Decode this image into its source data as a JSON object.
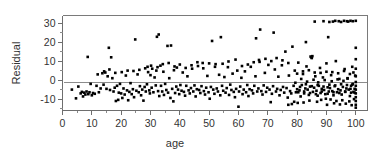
{
  "chart_data": {
    "type": "scatter",
    "title": "",
    "xlabel": "age",
    "ylabel": "Residual",
    "xlim": [
      0,
      104
    ],
    "ylim": [
      -16,
      34
    ],
    "xticks": [
      0,
      10,
      20,
      30,
      40,
      50,
      60,
      70,
      80,
      90,
      100
    ],
    "xticklabels": [
      "0",
      "10",
      "20",
      "30",
      "40",
      "50",
      "60",
      "70",
      "80",
      "90",
      "100"
    ],
    "yticks": [
      -10,
      0,
      10,
      20,
      30
    ],
    "yticklabels": [
      "-10",
      "0",
      "10",
      "20",
      "30"
    ],
    "grid": false,
    "legend": null,
    "minor_ticks": true,
    "marker": "square",
    "marker_color": "#000000",
    "marker_size": 2.6,
    "reference_line": {
      "type": "horizontal",
      "y": -1.0,
      "color": "#8c8c8c"
    },
    "frame": {
      "top": true,
      "right": true,
      "bottom": true,
      "left": true,
      "color": "#7a7a7a"
    },
    "points": [
      [
        3.2,
        -5.0
      ],
      [
        4.6,
        -9.6
      ],
      [
        5.4,
        -3.4
      ],
      [
        6.2,
        -7.0
      ],
      [
        6.6,
        -6.2
      ],
      [
        7.0,
        -8.6
      ],
      [
        7.4,
        -6.6
      ],
      [
        7.8,
        -7.6
      ],
      [
        8.2,
        -6.0
      ],
      [
        8.6,
        12.2
      ],
      [
        8.8,
        -7.4
      ],
      [
        9.2,
        -6.4
      ],
      [
        9.6,
        -2.0
      ],
      [
        10.0,
        -8.0
      ],
      [
        10.4,
        -6.8
      ],
      [
        11.0,
        -7.2
      ],
      [
        11.6,
        -3.0
      ],
      [
        12.4,
        -6.4
      ],
      [
        13.0,
        -4.4
      ],
      [
        13.6,
        3.6
      ],
      [
        14.0,
        -2.4
      ],
      [
        14.6,
        4.0
      ],
      [
        15.0,
        -4.6
      ],
      [
        15.4,
        2.0
      ],
      [
        15.8,
        17.0
      ],
      [
        16.2,
        -5.2
      ],
      [
        16.6,
        12.0
      ],
      [
        17.0,
        1.0
      ],
      [
        17.4,
        -6.0
      ],
      [
        17.8,
        -4.0
      ],
      [
        18.2,
        -11.0
      ],
      [
        18.6,
        -3.0
      ],
      [
        19.0,
        -10.4
      ],
      [
        19.2,
        -6.6
      ],
      [
        19.6,
        -2.0
      ],
      [
        20.0,
        -7.0
      ],
      [
        20.4,
        -9.4
      ],
      [
        20.8,
        -4.4
      ],
      [
        21.2,
        -7.6
      ],
      [
        21.6,
        2.4
      ],
      [
        22.0,
        -5.4
      ],
      [
        22.4,
        -10.6
      ],
      [
        22.8,
        -6.2
      ],
      [
        23.2,
        -1.6
      ],
      [
        23.6,
        -7.4
      ],
      [
        24.0,
        -4.8
      ],
      [
        24.4,
        -9.0
      ],
      [
        24.8,
        21.4
      ],
      [
        25.2,
        -5.6
      ],
      [
        25.6,
        3.0
      ],
      [
        26.0,
        -6.4
      ],
      [
        26.4,
        -3.2
      ],
      [
        26.8,
        -8.0
      ],
      [
        27.2,
        -5.0
      ],
      [
        27.6,
        -10.8
      ],
      [
        28.0,
        -3.6
      ],
      [
        28.4,
        -6.0
      ],
      [
        28.8,
        -2.2
      ],
      [
        29.0,
        7.0
      ],
      [
        29.2,
        4.2
      ],
      [
        29.6,
        -5.4
      ],
      [
        29.8,
        -7.0
      ],
      [
        30.0,
        2.6
      ],
      [
        30.4,
        -4.0
      ],
      [
        30.6,
        6.0
      ],
      [
        31.0,
        -6.4
      ],
      [
        31.4,
        1.4
      ],
      [
        31.8,
        -2.8
      ],
      [
        32.0,
        5.0
      ],
      [
        32.2,
        22.8
      ],
      [
        32.6,
        -5.8
      ],
      [
        32.8,
        24.0
      ],
      [
        33.0,
        -8.4
      ],
      [
        33.4,
        7.6
      ],
      [
        33.6,
        -3.0
      ],
      [
        34.0,
        -6.0
      ],
      [
        34.4,
        4.4
      ],
      [
        34.6,
        -7.8
      ],
      [
        35.0,
        -2.0
      ],
      [
        35.4,
        -5.2
      ],
      [
        35.8,
        18.0
      ],
      [
        36.0,
        -6.6
      ],
      [
        36.4,
        1.0
      ],
      [
        36.8,
        -9.4
      ],
      [
        37.0,
        18.2
      ],
      [
        37.4,
        -4.6
      ],
      [
        37.8,
        -11.2
      ],
      [
        38.0,
        5.2
      ],
      [
        38.4,
        -6.8
      ],
      [
        38.8,
        -3.4
      ],
      [
        39.0,
        6.6
      ],
      [
        39.4,
        -5.0
      ],
      [
        39.8,
        -7.4
      ],
      [
        40.2,
        -2.6
      ],
      [
        40.6,
        -5.6
      ],
      [
        41.0,
        4.0
      ],
      [
        41.4,
        -6.2
      ],
      [
        41.8,
        -8.2
      ],
      [
        42.2,
        -3.0
      ],
      [
        42.6,
        2.0
      ],
      [
        43.0,
        -5.4
      ],
      [
        43.4,
        -7.0
      ],
      [
        43.8,
        -4.2
      ],
      [
        44.2,
        6.0
      ],
      [
        44.6,
        -6.0
      ],
      [
        45.0,
        -2.8
      ],
      [
        45.4,
        -8.6
      ],
      [
        45.8,
        -4.8
      ],
      [
        46.2,
        7.4
      ],
      [
        46.6,
        -5.2
      ],
      [
        47.0,
        -6.8
      ],
      [
        47.4,
        -3.2
      ],
      [
        47.8,
        9.0
      ],
      [
        48.2,
        -5.8
      ],
      [
        48.6,
        -7.6
      ],
      [
        49.0,
        -4.0
      ],
      [
        49.4,
        2.2
      ],
      [
        49.8,
        -6.4
      ],
      [
        50.2,
        -9.8
      ],
      [
        50.6,
        -3.6
      ],
      [
        51.0,
        20.6
      ],
      [
        51.4,
        -5.0
      ],
      [
        51.8,
        -7.2
      ],
      [
        52.2,
        8.4
      ],
      [
        52.6,
        -4.4
      ],
      [
        53.0,
        -6.0
      ],
      [
        53.4,
        2.8
      ],
      [
        53.8,
        -8.0
      ],
      [
        54.0,
        22.6
      ],
      [
        54.4,
        -3.0
      ],
      [
        54.8,
        -5.6
      ],
      [
        55.2,
        1.6
      ],
      [
        55.6,
        -6.6
      ],
      [
        56.0,
        -4.2
      ],
      [
        56.4,
        6.8
      ],
      [
        56.8,
        -7.8
      ],
      [
        57.2,
        -2.4
      ],
      [
        57.6,
        -5.2
      ],
      [
        58.0,
        3.4
      ],
      [
        58.4,
        -6.2
      ],
      [
        58.8,
        -9.0
      ],
      [
        59.2,
        -4.6
      ],
      [
        59.6,
        5.0
      ],
      [
        60.0,
        -14.0
      ],
      [
        60.2,
        -6.0
      ],
      [
        60.6,
        -3.4
      ],
      [
        61.0,
        1.2
      ],
      [
        61.4,
        -7.4
      ],
      [
        61.8,
        -5.0
      ],
      [
        62.2,
        4.6
      ],
      [
        62.6,
        -6.4
      ],
      [
        63.0,
        -2.6
      ],
      [
        63.4,
        -8.4
      ],
      [
        63.8,
        -4.8
      ],
      [
        64.2,
        7.0
      ],
      [
        64.6,
        -5.4
      ],
      [
        65.0,
        -7.0
      ],
      [
        65.4,
        -3.0
      ],
      [
        65.8,
        2.0
      ],
      [
        66.0,
        22.0
      ],
      [
        66.4,
        -6.0
      ],
      [
        66.8,
        -4.4
      ],
      [
        67.2,
        9.6
      ],
      [
        67.4,
        26.6
      ],
      [
        67.8,
        -5.8
      ],
      [
        68.2,
        -7.6
      ],
      [
        68.6,
        -2.8
      ],
      [
        69.0,
        3.8
      ],
      [
        69.4,
        -6.2
      ],
      [
        69.8,
        -4.0
      ],
      [
        70.2,
        8.0
      ],
      [
        70.6,
        -5.0
      ],
      [
        71.0,
        -11.6
      ],
      [
        71.4,
        -7.2
      ],
      [
        71.8,
        -3.2
      ],
      [
        72.0,
        25.0
      ],
      [
        72.4,
        5.6
      ],
      [
        72.8,
        -6.0
      ],
      [
        73.2,
        -4.6
      ],
      [
        73.6,
        1.8
      ],
      [
        74.0,
        -8.0
      ],
      [
        74.4,
        -5.2
      ],
      [
        74.8,
        7.8
      ],
      [
        75.2,
        -3.6
      ],
      [
        75.6,
        -6.6
      ],
      [
        76.0,
        15.0
      ],
      [
        76.4,
        -4.2
      ],
      [
        76.8,
        -9.2
      ],
      [
        77.0,
        -13.0
      ],
      [
        77.2,
        2.4
      ],
      [
        77.6,
        -5.8
      ],
      [
        78.0,
        -7.0
      ],
      [
        78.4,
        17.6
      ],
      [
        78.8,
        -3.0
      ],
      [
        79.0,
        -11.4
      ],
      [
        79.2,
        5.0
      ],
      [
        79.6,
        -6.4
      ],
      [
        80.0,
        -4.8
      ],
      [
        80.4,
        9.2
      ],
      [
        80.8,
        -5.4
      ],
      [
        81.2,
        -8.6
      ],
      [
        81.6,
        -2.6
      ],
      [
        82.0,
        3.2
      ],
      [
        82.4,
        -6.0
      ],
      [
        82.8,
        -4.4
      ],
      [
        83.0,
        20.0
      ],
      [
        83.2,
        7.2
      ],
      [
        83.6,
        -5.0
      ],
      [
        84.0,
        -7.8
      ],
      [
        84.4,
        -3.4
      ],
      [
        84.6,
        12.4
      ],
      [
        84.8,
        12.0
      ],
      [
        85.0,
        11.6
      ],
      [
        85.2,
        12.6
      ],
      [
        85.4,
        -6.2
      ],
      [
        85.8,
        -4.0
      ],
      [
        86.0,
        30.8
      ],
      [
        86.2,
        2.0
      ],
      [
        86.6,
        -5.6
      ],
      [
        87.0,
        -8.2
      ],
      [
        87.4,
        -3.0
      ],
      [
        87.8,
        6.4
      ],
      [
        88.0,
        -6.8
      ],
      [
        88.4,
        -4.6
      ],
      [
        88.8,
        1.4
      ],
      [
        89.0,
        31.0
      ],
      [
        89.2,
        -5.2
      ],
      [
        89.6,
        -7.4
      ],
      [
        90.0,
        8.8
      ],
      [
        90.4,
        -3.8
      ],
      [
        90.6,
        22.6
      ],
      [
        90.8,
        -6.0
      ],
      [
        91.0,
        30.6
      ],
      [
        91.2,
        -4.2
      ],
      [
        91.6,
        2.6
      ],
      [
        92.0,
        -5.8
      ],
      [
        92.2,
        30.8
      ],
      [
        92.4,
        -8.0
      ],
      [
        92.8,
        -3.2
      ],
      [
        93.0,
        31.2
      ],
      [
        93.2,
        10.0
      ],
      [
        93.6,
        -6.4
      ],
      [
        94.0,
        -4.8
      ],
      [
        94.2,
        31.0
      ],
      [
        94.4,
        0.6
      ],
      [
        94.8,
        -5.4
      ],
      [
        95.0,
        30.6
      ],
      [
        95.2,
        -7.6
      ],
      [
        95.6,
        -3.6
      ],
      [
        96.0,
        31.2
      ],
      [
        96.2,
        5.8
      ],
      [
        96.4,
        -6.0
      ],
      [
        96.8,
        -4.4
      ],
      [
        97.0,
        31.0
      ],
      [
        97.2,
        1.0
      ],
      [
        97.4,
        30.8
      ],
      [
        97.6,
        -5.0
      ],
      [
        98.0,
        -8.4
      ],
      [
        98.2,
        31.2
      ],
      [
        98.4,
        -3.0
      ],
      [
        98.8,
        7.0
      ],
      [
        99.0,
        31.0
      ],
      [
        99.2,
        -6.2
      ],
      [
        99.6,
        -4.6
      ],
      [
        100.0,
        31.2
      ],
      [
        100.0,
        17.0
      ],
      [
        100.0,
        11.0
      ],
      [
        100.0,
        6.0
      ],
      [
        100.0,
        2.0
      ],
      [
        100.0,
        -1.0
      ],
      [
        100.0,
        -3.0
      ],
      [
        100.0,
        -5.0
      ],
      [
        100.0,
        -7.0
      ],
      [
        100.0,
        -9.0
      ],
      [
        100.0,
        -11.0
      ],
      [
        100.0,
        -13.0
      ],
      [
        100.0,
        -14.5
      ],
      [
        88.2,
        -10.4
      ],
      [
        89.8,
        -9.8
      ],
      [
        91.4,
        -10.2
      ],
      [
        93.4,
        -11.0
      ],
      [
        95.4,
        -10.6
      ],
      [
        97.8,
        -11.2
      ],
      [
        99.4,
        -10.0
      ],
      [
        86.8,
        -11.4
      ],
      [
        84.2,
        -10.8
      ],
      [
        82.2,
        -11.8
      ],
      [
        80.2,
        -12.0
      ],
      [
        78.2,
        -12.6
      ],
      [
        92.6,
        -12.2
      ],
      [
        94.6,
        -12.8
      ],
      [
        96.6,
        -12.4
      ],
      [
        98.6,
        -13.2
      ],
      [
        90.2,
        -13.0
      ],
      [
        89.4,
        0.0
      ],
      [
        91.8,
        -0.6
      ],
      [
        93.8,
        0.4
      ],
      [
        95.8,
        -0.4
      ],
      [
        97.2,
        0.8
      ],
      [
        87.2,
        -1.2
      ],
      [
        85.6,
        0.2
      ],
      [
        83.4,
        -0.8
      ],
      [
        81.4,
        0.6
      ],
      [
        79.4,
        -1.4
      ],
      [
        92.0,
        4.2
      ],
      [
        94.0,
        3.6
      ],
      [
        96.0,
        4.8
      ],
      [
        98.0,
        3.2
      ],
      [
        90.0,
        4.4
      ],
      [
        88.0,
        3.8
      ],
      [
        86.0,
        4.0
      ],
      [
        84.0,
        5.2
      ],
      [
        82.0,
        4.6
      ],
      [
        80.0,
        3.4
      ],
      [
        91.0,
        -2.4
      ],
      [
        93.0,
        -2.8
      ],
      [
        95.0,
        -2.2
      ],
      [
        97.0,
        -2.6
      ],
      [
        99.0,
        -2.0
      ],
      [
        89.0,
        -3.4
      ],
      [
        87.0,
        -2.6
      ],
      [
        85.0,
        -3.2
      ],
      [
        83.0,
        -2.2
      ],
      [
        81.0,
        -3.6
      ],
      [
        92.4,
        -6.4
      ],
      [
        94.4,
        -6.8
      ],
      [
        96.4,
        -6.2
      ],
      [
        98.4,
        -6.6
      ],
      [
        90.4,
        -7.2
      ],
      [
        88.4,
        -6.0
      ],
      [
        86.4,
        -7.4
      ],
      [
        84.4,
        -6.8
      ],
      [
        82.4,
        -7.0
      ],
      [
        80.4,
        -6.4
      ],
      [
        99.8,
        2.4
      ],
      [
        99.6,
        -6.6
      ],
      [
        99.2,
        4.0
      ],
      [
        98.8,
        -2.4
      ],
      [
        98.2,
        -4.6
      ],
      [
        73.0,
        11.6
      ],
      [
        75.0,
        10.4
      ],
      [
        77.0,
        9.0
      ],
      [
        71.2,
        10.0
      ],
      [
        69.2,
        11.2
      ],
      [
        67.0,
        10.6
      ],
      [
        65.2,
        9.4
      ],
      [
        63.2,
        8.2
      ],
      [
        61.2,
        7.4
      ],
      [
        59.0,
        10.8
      ],
      [
        56.6,
        9.8
      ],
      [
        54.6,
        8.6
      ],
      [
        52.0,
        7.0
      ],
      [
        50.0,
        8.8
      ],
      [
        48.0,
        6.2
      ],
      [
        46.0,
        9.4
      ],
      [
        44.0,
        7.8
      ],
      [
        42.0,
        6.4
      ],
      [
        40.0,
        8.2
      ],
      [
        38.2,
        7.2
      ],
      [
        36.2,
        9.0
      ],
      [
        34.2,
        8.4
      ],
      [
        32.4,
        6.8
      ],
      [
        30.2,
        7.6
      ],
      [
        28.2,
        6.2
      ],
      [
        26.2,
        5.4
      ],
      [
        24.2,
        4.8
      ],
      [
        22.2,
        5.0
      ],
      [
        20.2,
        4.2
      ],
      [
        18.0,
        3.8
      ],
      [
        16.0,
        5.6
      ],
      [
        14.2,
        4.6
      ],
      [
        12.0,
        3.0
      ]
    ]
  }
}
